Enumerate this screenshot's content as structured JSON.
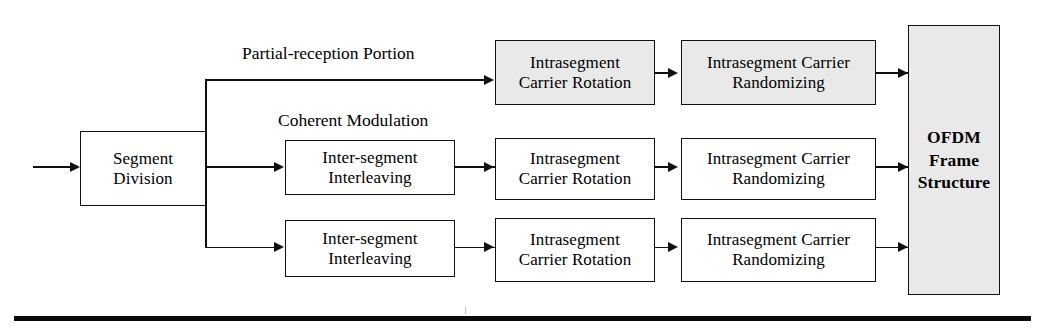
{
  "diagram": {
    "colors": {
      "stroke": "#111111",
      "shaded_fill": "#e9e9e9",
      "plain_fill": "#ffffff",
      "rule": "#0a0a0a"
    },
    "branch_labels": [
      {
        "id": "partial-reception-portion",
        "text": "Partial-reception Portion"
      },
      {
        "id": "coherent-modulation",
        "text": "Coherent Modulation"
      }
    ],
    "input": {
      "id": "input-arrow",
      "text": ""
    },
    "blocks": {
      "segment_division": {
        "line1": "Segment",
        "line2": "Division"
      },
      "top_rotation": {
        "line1": "Intrasegment",
        "line2": "Carrier Rotation"
      },
      "top_randomizing": {
        "line1": "Intrasegment Carrier",
        "line2": "Randomizing"
      },
      "mid_interleaving": {
        "line1": "Inter-segment",
        "line2": "Interleaving"
      },
      "mid_rotation": {
        "line1": "Intrasegment",
        "line2": "Carrier Rotation"
      },
      "mid_randomizing": {
        "line1": "Intrasegment Carrier",
        "line2": "Randomizing"
      },
      "bot_interleaving": {
        "line1": "Inter-segment",
        "line2": "Interleaving"
      },
      "bot_rotation": {
        "line1": "Intrasegment",
        "line2": "Carrier Rotation"
      },
      "bot_randomizing": {
        "line1": "Intrasegment Carrier",
        "line2": "Randomizing"
      },
      "ofdm": {
        "line1": "OFDM",
        "line2": "Frame",
        "line3": "Structure"
      }
    }
  }
}
